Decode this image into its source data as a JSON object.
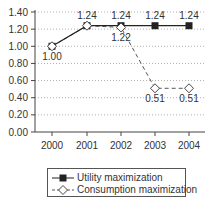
{
  "chart_data": {
    "type": "line",
    "title": "",
    "xlabel": "",
    "ylabel": "",
    "categories": [
      "2000",
      "2001",
      "2002",
      "2003",
      "2004"
    ],
    "series": [
      {
        "name": "Utility maximization",
        "values": [
          1.0,
          1.24,
          1.24,
          1.24,
          1.24
        ],
        "marker": "filled-square",
        "line": "solid",
        "color": "#222222"
      },
      {
        "name": "Consumption maximization",
        "values": [
          1.0,
          1.24,
          1.22,
          0.51,
          0.51
        ],
        "marker": "open-diamond",
        "line": "dashed",
        "color": "#555555"
      }
    ],
    "data_labels": [
      {
        "x": "2000",
        "text": "1.00",
        "position": "below"
      },
      {
        "x": "2001",
        "text": "1.24",
        "position": "above"
      },
      {
        "x": "2002",
        "text": "1.24",
        "position": "above"
      },
      {
        "x": "2002",
        "text": "1.22",
        "position": "below"
      },
      {
        "x": "2003",
        "text": "1.24",
        "position": "above"
      },
      {
        "x": "2003",
        "text": "0.51",
        "position": "below"
      },
      {
        "x": "2004",
        "text": "1.24",
        "position": "above"
      },
      {
        "x": "2004",
        "text": "0.51",
        "position": "below"
      }
    ],
    "y_ticks": [
      "0.00",
      "0.20",
      "0.40",
      "0.60",
      "0.80",
      "1.00",
      "1.20",
      "1.40"
    ],
    "ylim": [
      0,
      1.4
    ],
    "grid": "horizontal dotted",
    "legend_position": "bottom"
  },
  "legend": {
    "items": [
      {
        "label": "Utility maximization"
      },
      {
        "label": "Consumption maximization"
      }
    ]
  }
}
